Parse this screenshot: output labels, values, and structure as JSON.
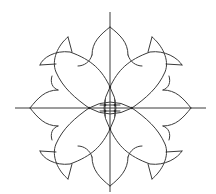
{
  "diagram": {
    "type": "geometric-rosette",
    "stroke_color": "#3a3a3a",
    "background": "#ffffff",
    "center": [
      110,
      108
    ],
    "axes": {
      "vertical": {
        "x": 110,
        "y1": 12,
        "y2": 192
      },
      "horizontal": {
        "y": 108,
        "x1": 15,
        "x2": 206
      }
    },
    "petal_tips": {
      "top": [
        110,
        27
      ],
      "bottom": [
        110,
        186
      ],
      "left": [
        30,
        108
      ],
      "right": [
        191,
        108
      ]
    },
    "corner_barbs": {
      "top_right": [
        [
          152,
          37
        ],
        [
          182,
          65
        ]
      ],
      "top_left": [
        [
          68,
          37
        ],
        [
          40,
          65
        ]
      ],
      "bottom_left": [
        [
          40,
          151
        ],
        [
          68,
          179
        ]
      ],
      "bottom_right": [
        [
          182,
          151
        ],
        [
          152,
          179
        ]
      ]
    },
    "center_dots": [
      [
        105,
        105
      ],
      [
        115,
        105
      ],
      [
        105,
        111
      ],
      [
        115,
        111
      ]
    ]
  }
}
